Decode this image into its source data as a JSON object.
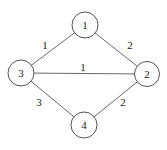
{
  "graph": {
    "nodes": [
      {
        "id": "1",
        "label": "1",
        "x": 85,
        "y": 25
      },
      {
        "id": "2",
        "label": "2",
        "x": 147,
        "y": 74
      },
      {
        "id": "3",
        "label": "3",
        "x": 21,
        "y": 73
      },
      {
        "id": "4",
        "label": "4",
        "x": 84,
        "y": 125
      }
    ],
    "edges": [
      {
        "from": "3",
        "to": "1",
        "weight": "1",
        "label_x": 45,
        "label_y": 45
      },
      {
        "from": "1",
        "to": "2",
        "weight": "2",
        "label_x": 130,
        "label_y": 45
      },
      {
        "from": "3",
        "to": "2",
        "weight": "1",
        "label_x": 83,
        "label_y": 67
      },
      {
        "from": "3",
        "to": "4",
        "weight": "3",
        "label_x": 39,
        "label_y": 102
      },
      {
        "from": "4",
        "to": "2",
        "weight": "2",
        "label_x": 123,
        "label_y": 102
      }
    ]
  }
}
